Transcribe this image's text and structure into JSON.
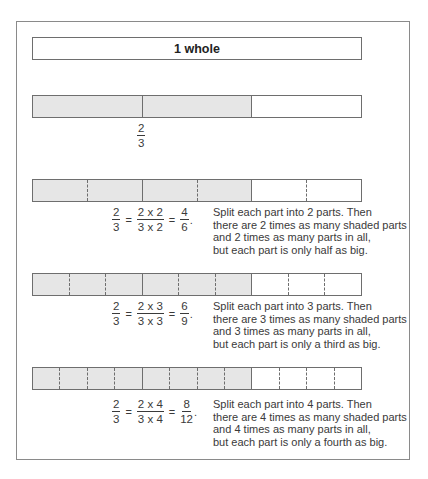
{
  "whole_label": "1 whole",
  "base_fraction": {
    "numerator": "2",
    "denominator": "3"
  },
  "colors": {
    "shaded": "#e6e6e6",
    "border": "#6e6e6e",
    "frame": "#8a8a8a",
    "text": "#3a3a3a"
  },
  "rows": [
    {
      "split": 2,
      "equation": {
        "lhs": {
          "numerator": "2",
          "denominator": "3"
        },
        "mid": {
          "numerator": "2 x 2",
          "denominator": "3 x 2"
        },
        "rhs": {
          "numerator": "4",
          "denominator": "6"
        },
        "eq1": "=",
        "eq2": "=",
        "end": "."
      },
      "lines": [
        "Split each part into 2 parts. Then",
        "there are 2 times as many shaded parts",
        "and 2 times as many parts in all,",
        "but each part is only half as big."
      ]
    },
    {
      "split": 3,
      "equation": {
        "lhs": {
          "numerator": "2",
          "denominator": "3"
        },
        "mid": {
          "numerator": "2 x 3",
          "denominator": "3 x 3"
        },
        "rhs": {
          "numerator": "6",
          "denominator": "9"
        },
        "eq1": "=",
        "eq2": "=",
        "end": "."
      },
      "lines": [
        "Split each part into 3 parts. Then",
        "there are 3 times as many shaded parts",
        "and 3 times as many parts in all,",
        "but each part is only a third as big."
      ]
    },
    {
      "split": 4,
      "equation": {
        "lhs": {
          "numerator": "2",
          "denominator": "3"
        },
        "mid": {
          "numerator": "2 x 4",
          "denominator": "3 x 4"
        },
        "rhs": {
          "numerator": "8",
          "denominator": "12"
        },
        "eq1": "=",
        "eq2": "=",
        "end": "."
      },
      "lines": [
        "Split each part into 4 parts. Then",
        "there are 4 times as many shaded parts",
        "and 4 times as many parts in all,",
        "but each part is only a fourth as big."
      ]
    }
  ]
}
